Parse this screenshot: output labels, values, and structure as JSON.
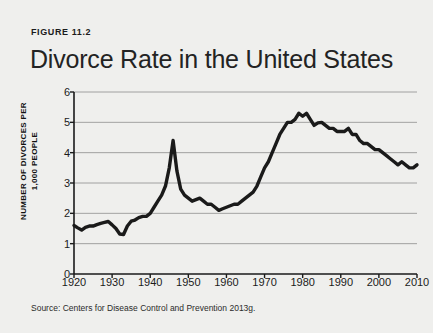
{
  "figure": {
    "label": "FIGURE 11.2",
    "title": "Divorce Rate in the United States",
    "source": "Source: Centers for Disease Control and Prevention 2013g."
  },
  "colors": {
    "background": "#efefed",
    "line": "#1a1a1a",
    "grid": "#8d8d8d",
    "axis": "#1a1a1a",
    "text": "#1b1b1b"
  },
  "chart_data": {
    "type": "line",
    "title": "Divorce Rate in the United States",
    "xlabel": "",
    "ylabel": "NUMBER OF DIVORCES PER 1,000 PEOPLE",
    "ylabel_line1": "NUMBER OF DIVORCES PER",
    "ylabel_line2": "1,000 PEOPLE",
    "xlim": [
      1920,
      2010
    ],
    "ylim": [
      0,
      6
    ],
    "yticks": [
      0,
      1,
      2,
      3,
      4,
      5,
      6
    ],
    "xticks": [
      1920,
      1930,
      1940,
      1950,
      1960,
      1970,
      1980,
      1990,
      2000,
      2010
    ],
    "grid": true,
    "legend": false,
    "series": [
      {
        "name": "Divorce rate per 1,000 people",
        "x": [
          1920,
          1921,
          1922,
          1923,
          1924,
          1925,
          1926,
          1927,
          1928,
          1929,
          1930,
          1931,
          1932,
          1933,
          1934,
          1935,
          1936,
          1937,
          1938,
          1939,
          1940,
          1941,
          1942,
          1943,
          1944,
          1945,
          1946,
          1947,
          1948,
          1949,
          1950,
          1951,
          1952,
          1953,
          1954,
          1955,
          1956,
          1957,
          1958,
          1959,
          1960,
          1961,
          1962,
          1963,
          1964,
          1965,
          1966,
          1967,
          1968,
          1969,
          1970,
          1971,
          1972,
          1973,
          1974,
          1975,
          1976,
          1977,
          1978,
          1979,
          1980,
          1981,
          1982,
          1983,
          1984,
          1985,
          1986,
          1987,
          1988,
          1989,
          1990,
          1991,
          1992,
          1993,
          1994,
          1995,
          1996,
          1997,
          1998,
          1999,
          2000,
          2001,
          2002,
          2003,
          2004,
          2005,
          2006,
          2007,
          2008,
          2009,
          2010
        ],
        "values": [
          1.6,
          1.52,
          1.45,
          1.54,
          1.58,
          1.58,
          1.63,
          1.67,
          1.7,
          1.73,
          1.62,
          1.5,
          1.32,
          1.3,
          1.58,
          1.74,
          1.78,
          1.86,
          1.9,
          1.9,
          2.0,
          2.2,
          2.4,
          2.6,
          2.9,
          3.5,
          4.4,
          3.4,
          2.8,
          2.6,
          2.5,
          2.4,
          2.45,
          2.5,
          2.4,
          2.3,
          2.3,
          2.2,
          2.1,
          2.15,
          2.2,
          2.25,
          2.3,
          2.3,
          2.4,
          2.5,
          2.6,
          2.7,
          2.9,
          3.2,
          3.5,
          3.7,
          4.0,
          4.3,
          4.6,
          4.8,
          5.0,
          5.0,
          5.1,
          5.3,
          5.2,
          5.3,
          5.1,
          4.9,
          4.98,
          5.0,
          4.9,
          4.8,
          4.8,
          4.7,
          4.7,
          4.7,
          4.8,
          4.6,
          4.6,
          4.4,
          4.3,
          4.3,
          4.2,
          4.1,
          4.1,
          4.0,
          3.9,
          3.8,
          3.7,
          3.6,
          3.7,
          3.6,
          3.5,
          3.5,
          3.6
        ]
      }
    ]
  }
}
